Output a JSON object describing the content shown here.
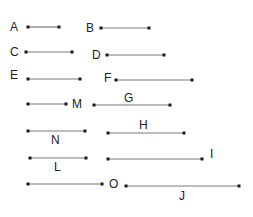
{
  "diagram": {
    "title": "",
    "segments": [
      {
        "id": "A",
        "label": "A"
      },
      {
        "id": "B",
        "label": "B"
      },
      {
        "id": "C",
        "label": "C"
      },
      {
        "id": "D",
        "label": "D"
      },
      {
        "id": "E",
        "label": "E"
      },
      {
        "id": "F",
        "label": "F"
      },
      {
        "id": "M",
        "label": "M"
      },
      {
        "id": "G",
        "label": "G"
      },
      {
        "id": "N",
        "label": "N"
      },
      {
        "id": "H",
        "label": "H"
      },
      {
        "id": "L",
        "label": "L"
      },
      {
        "id": "I",
        "label": "I"
      },
      {
        "id": "O",
        "label": "O"
      },
      {
        "id": "J",
        "label": "J"
      }
    ],
    "colors": {
      "line": "#7a7a7a",
      "endpoint": "#1a1a1a",
      "label": "#222222",
      "background": "#ffffff"
    }
  }
}
